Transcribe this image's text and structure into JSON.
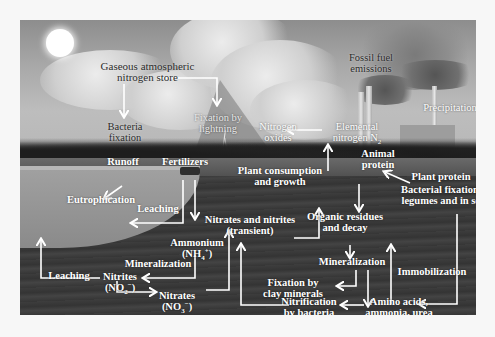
{
  "diagram": {
    "colors": {
      "page_background": "#f7f7f7",
      "sky": "#a8a8a8",
      "ground": "#3a3a3a",
      "label_light": "#ffffff",
      "label_dark": "#2b2b2b",
      "arrow": "#ffffff"
    },
    "labels": {
      "gaseous_store_1": "Gaseous atmospheric",
      "gaseous_store_2": "nitrogen store",
      "bacteria_fixation_1": "Bacteria",
      "bacteria_fixation_2": "fixation",
      "lightning_1": "Fixation by",
      "lightning_2": "lightning",
      "fossil_1": "Fossil fuel",
      "fossil_2": "emissions",
      "precipitation": "Precipitation",
      "nitrogen_oxides_1": "Nitrogen",
      "nitrogen_oxides_2": "oxides",
      "elemental_1": "Elemental",
      "elemental_2": "nitrogen N",
      "elemental_sub": "2",
      "animal_protein_1": "Animal",
      "animal_protein_2": "protein",
      "plant_protein": "Plant protein",
      "runoff": "Runoff",
      "fertilizers": "Fertilizers",
      "plant_consumption_1": "Plant consumption",
      "plant_consumption_2": "and growth",
      "bacterial_fixation_legumes_1": "Bacterial fixation in",
      "bacterial_fixation_legumes_2": "legumes and in soil",
      "eutrophication": "Eutrophication",
      "leaching_upper": "Leaching",
      "nitrates_nitrites_1": "Nitrates and nitrites",
      "nitrates_nitrites_2": "(transient)",
      "organic_residues_1": "Organic residues",
      "organic_residues_2": "and decay",
      "ammonium": "Ammonium",
      "ammonium_formula": "(NH",
      "ammonium_sub": "4",
      "ammonium_sup": "+",
      "ammonium_close": ")",
      "mineralization_left": "Mineralization",
      "mineralization_right": "Mineralization",
      "immobilization": "Immobilization",
      "leaching_lower": "Leaching",
      "nitrites": "Nitrites",
      "nitrites_formula": "(NO",
      "nitrites_sub": "2",
      "nitrites_sup": "−",
      "nitrites_close": ")",
      "fixation_clay_1": "Fixation by",
      "fixation_clay_2": "clay minerals",
      "nitrates": "Nitrates",
      "nitrates_formula": "(NO",
      "nitrates_sub": "3",
      "nitrates_sup": "−",
      "nitrates_close": ")",
      "nitrification_1": "Nitrification",
      "nitrification_2": "by bacteria",
      "amino_acids_1": "Amino acids,",
      "amino_acids_2": "ammonia, urea"
    }
  }
}
